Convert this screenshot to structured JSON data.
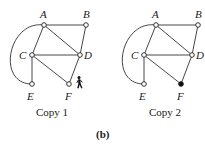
{
  "figure_label": "(b)",
  "copies": [
    {
      "caption": "Copy 1",
      "offset_x": 0,
      "nodes": [
        {
          "id": "A",
          "x": 44,
          "y": 25,
          "filled": false
        },
        {
          "id": "B",
          "x": 86,
          "y": 25,
          "filled": false
        },
        {
          "id": "C",
          "x": 32,
          "y": 55,
          "filled": false
        },
        {
          "id": "D",
          "x": 80,
          "y": 55,
          "filled": false
        },
        {
          "id": "E",
          "x": 32,
          "y": 84,
          "filled": false
        },
        {
          "id": "F",
          "x": 69,
          "y": 84,
          "filled": false
        }
      ],
      "edges": [
        [
          "A",
          "B"
        ],
        [
          "A",
          "C"
        ],
        [
          "A",
          "D"
        ],
        [
          "B",
          "D"
        ],
        [
          "C",
          "D"
        ],
        [
          "C",
          "E"
        ],
        [
          "C",
          "F"
        ],
        [
          "D",
          "F"
        ]
      ],
      "arc": [
        "A",
        "E"
      ],
      "marker": {
        "icon": "walking-person-icon",
        "near": "F"
      }
    },
    {
      "caption": "Copy 2",
      "offset_x": 102,
      "nodes": [
        {
          "id": "A",
          "x": 54,
          "y": 25,
          "filled": false
        },
        {
          "id": "B",
          "x": 96,
          "y": 25,
          "filled": false
        },
        {
          "id": "C",
          "x": 42,
          "y": 55,
          "filled": false
        },
        {
          "id": "D",
          "x": 90,
          "y": 55,
          "filled": false
        },
        {
          "id": "E",
          "x": 42,
          "y": 84,
          "filled": false
        },
        {
          "id": "F",
          "x": 79,
          "y": 84,
          "filled": true
        }
      ],
      "edges": [
        [
          "A",
          "B"
        ],
        [
          "A",
          "C"
        ],
        [
          "A",
          "D"
        ],
        [
          "B",
          "D"
        ],
        [
          "C",
          "D"
        ],
        [
          "C",
          "E"
        ],
        [
          "C",
          "F"
        ],
        [
          "D",
          "F"
        ]
      ],
      "arc": [
        "A",
        "E"
      ]
    }
  ]
}
